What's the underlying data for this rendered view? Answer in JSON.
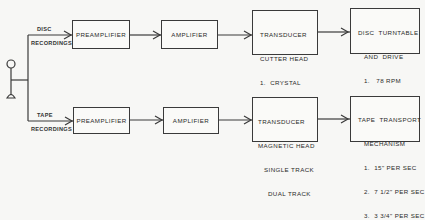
{
  "diagram": {
    "source": {
      "icon": "microphone-icon"
    },
    "branches": [
      {
        "label_top": "DISC",
        "label_bottom": "RECORDINGS",
        "blocks": [
          {
            "title": "PREAMPLIFIER"
          },
          {
            "title": "AMPLIFIER"
          },
          {
            "title": "TRANSDUCER",
            "subtitle": "CUTTER HEAD",
            "items": [
              "1.  CRYSTAL",
              "2.  MAGNETIC"
            ]
          },
          {
            "title": "DISC  TURNTABLE",
            "subtitle": "AND  DRIVE",
            "items": [
              "1.   78 RPM",
              "2.   33 1/3 RPM"
            ]
          }
        ]
      },
      {
        "label_top": "TAPE",
        "label_bottom": "RECORDINGS",
        "blocks": [
          {
            "title": "PREAMPLIFIER"
          },
          {
            "title": "AMPLIFIER"
          },
          {
            "title": "TRANSDUCER",
            "subtitle": "MAGNETIC HEAD",
            "items": [
              "SINGLE TRACK",
              "DUAL TRACK"
            ]
          },
          {
            "title": "TAPE  TRANSPORT",
            "subtitle": "MECHANISM",
            "items": [
              "1.  15\" PER SEC",
              "2.  7 1/2\" PER SEC",
              "3.  3 3/4\" PER SEC"
            ]
          }
        ]
      }
    ]
  }
}
